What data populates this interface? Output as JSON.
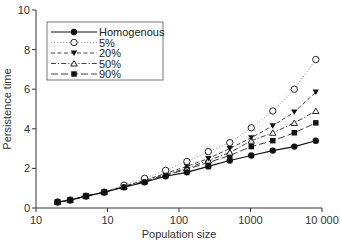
{
  "chart_data": {
    "type": "line",
    "title": "",
    "xlabel": "Population size",
    "ylabel": "Persistence time",
    "xscale": "log",
    "xlim": [
      1,
      10000
    ],
    "ylim": [
      0,
      10
    ],
    "x_ticks": [
      1,
      10,
      100,
      1000,
      10000
    ],
    "x_tick_labels": [
      "10",
      "10",
      "100",
      "1000",
      "10 000"
    ],
    "y_ticks": [
      0,
      2,
      4,
      6,
      8,
      10
    ],
    "y_tick_labels": [
      "0",
      "2",
      "4",
      "6",
      "8",
      "10"
    ],
    "grid": false,
    "legend_position": "upper left",
    "x": [
      2,
      3,
      5,
      9,
      17,
      33,
      65,
      129,
      257,
      513,
      1025,
      2049,
      4097,
      8193
    ],
    "series": [
      {
        "name": "Homogenous",
        "marker": "filled-circle",
        "line": "solid",
        "values": [
          0.3,
          0.4,
          0.6,
          0.8,
          1.05,
          1.3,
          1.6,
          1.8,
          2.1,
          2.4,
          2.65,
          2.9,
          3.1,
          3.4
        ]
      },
      {
        "name": "5%",
        "marker": "open-circle",
        "line": "dotted",
        "values": [
          0.3,
          0.4,
          0.6,
          0.8,
          1.15,
          1.5,
          1.9,
          2.35,
          2.85,
          3.3,
          4.05,
          4.9,
          6.0,
          7.5
        ]
      },
      {
        "name": "20%",
        "marker": "filled-triangle-down",
        "line": "dashed",
        "values": [
          0.3,
          0.4,
          0.6,
          0.8,
          1.1,
          1.4,
          1.75,
          2.1,
          2.5,
          3.0,
          3.55,
          4.15,
          4.85,
          5.85
        ]
      },
      {
        "name": "50%",
        "marker": "open-triangle-up",
        "line": "dash-dot",
        "values": [
          0.3,
          0.4,
          0.6,
          0.8,
          1.08,
          1.35,
          1.7,
          2.0,
          2.4,
          2.8,
          3.4,
          3.8,
          4.3,
          4.9
        ]
      },
      {
        "name": "90%",
        "marker": "filled-square",
        "line": "long-dash",
        "values": [
          0.3,
          0.4,
          0.6,
          0.8,
          1.06,
          1.32,
          1.65,
          1.95,
          2.3,
          2.65,
          3.1,
          3.4,
          3.8,
          4.3
        ]
      }
    ]
  },
  "axes": {
    "xlabel": "Population size",
    "ylabel": "Persistence time"
  },
  "legend": {
    "items": [
      {
        "label": "Homogenous"
      },
      {
        "label": "5%"
      },
      {
        "label": "20%"
      },
      {
        "label": "50%"
      },
      {
        "label": "90%"
      }
    ]
  },
  "colors": {
    "axis": "#333333",
    "series": "#111111",
    "dotted_line": "#888888"
  }
}
